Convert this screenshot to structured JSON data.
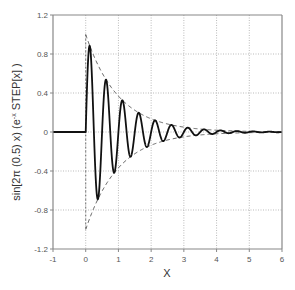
{
  "chart_data": {
    "type": "line",
    "title": "",
    "xlabel": "X",
    "ylabel": {
      "prefix": "sin[2π (0.5) x) (e",
      "superscript": "-x",
      "suffix": " STEP[x] )"
    },
    "xlim": [
      -1,
      6
    ],
    "ylim": [
      -1.2,
      1.2
    ],
    "xticks": [
      -1,
      0,
      1,
      2,
      3,
      4,
      5,
      6
    ],
    "xtick_labels": [
      "-1",
      "0",
      "1",
      "2",
      "3",
      "4",
      "5",
      "6"
    ],
    "yticks": [
      1.2,
      0.8,
      0.4,
      0,
      -0.4,
      -0.8,
      -1.2
    ],
    "ytick_labels": [
      "1.2",
      "0.8",
      "0.4",
      "0",
      "-0.4",
      "-0.8",
      "-1.2"
    ],
    "grid": true,
    "legend": "none",
    "series": [
      {
        "name": "damped-sine",
        "style": "solid",
        "color": "#111111",
        "function": "sin(2*pi*2*x) * exp(-x) * step(x)",
        "frequency": 2,
        "decay": 1,
        "domain": [
          -1,
          6
        ],
        "peaks": [
          {
            "x": 0.125,
            "y": 0.88
          },
          {
            "x": 0.625,
            "y": 0.54
          },
          {
            "x": 1.125,
            "y": 0.32
          },
          {
            "x": 1.625,
            "y": 0.2
          },
          {
            "x": 2.125,
            "y": 0.12
          }
        ],
        "troughs": [
          {
            "x": 0.375,
            "y": -0.69
          },
          {
            "x": 0.875,
            "y": -0.42
          },
          {
            "x": 1.375,
            "y": -0.25
          },
          {
            "x": 1.875,
            "y": -0.15
          }
        ]
      },
      {
        "name": "upper-envelope",
        "style": "dashed",
        "color": "#555555",
        "function": "exp(-x)",
        "domain": [
          0,
          6
        ]
      },
      {
        "name": "lower-envelope",
        "style": "dashed",
        "color": "#555555",
        "function": "-exp(-x)",
        "domain": [
          0,
          6
        ]
      }
    ],
    "colors": {
      "axis": "#888888",
      "grid": "#aaaaaa",
      "curve": "#111111",
      "envelope": "#555555"
    }
  }
}
